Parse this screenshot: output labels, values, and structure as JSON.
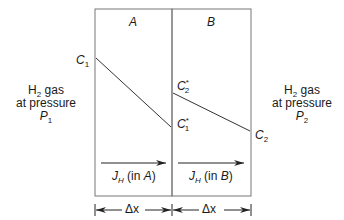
{
  "diagram": {
    "regions": [
      {
        "id": "A",
        "label": "A",
        "flux_label_sym": "J",
        "flux_label_sub": "H",
        "flux_label_text": " (in ",
        "flux_label_region": "A",
        "flux_label_close": ")",
        "width_label": "Δx"
      },
      {
        "id": "B",
        "label": "B",
        "flux_label_sym": "J",
        "flux_label_sub": "H",
        "flux_label_text": " (in ",
        "flux_label_region": "B",
        "flux_label_close": ")",
        "width_label": "Δx"
      }
    ],
    "left_side": {
      "line1_prefix": "H",
      "line1_sub": "2",
      "line1_suffix": " gas",
      "line2": "at pressure",
      "line3_sym": "P",
      "line3_sub": "1"
    },
    "right_side": {
      "line1_prefix": "H",
      "line1_sub": "2",
      "line1_suffix": " gas",
      "line2": "at pressure",
      "line3_sym": "P",
      "line3_sub": "2"
    },
    "concentrations": {
      "c1": {
        "sym": "C",
        "sub": "1",
        "sup": ""
      },
      "c1_star": {
        "sym": "C",
        "sub": "1",
        "sup": "*"
      },
      "c2_star": {
        "sym": "C",
        "sub": "2",
        "sup": "*"
      },
      "c2": {
        "sym": "C",
        "sub": "2",
        "sup": ""
      }
    },
    "colors": {
      "line": "#555555",
      "text": "#1a1a1a"
    }
  }
}
